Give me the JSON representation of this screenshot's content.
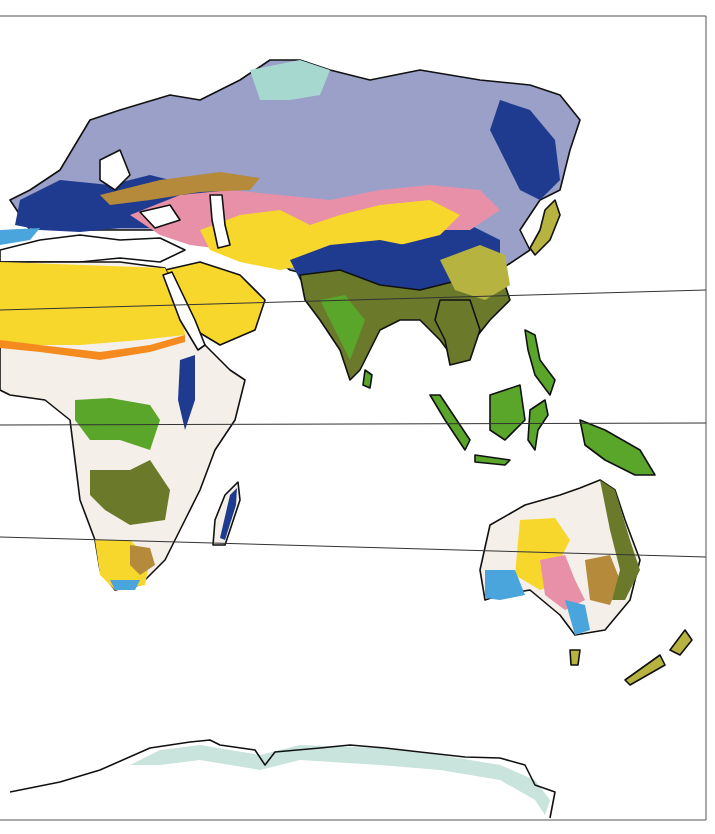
{
  "map": {
    "type": "climate-zones",
    "region": "Eastern Hemisphere",
    "continents": [
      "Europe",
      "Asia",
      "Africa",
      "Australia",
      "Antarctica"
    ],
    "latitude_lines": 3,
    "colors": {
      "ocean": "#ffffff",
      "tundra": "#a7d8cf",
      "subarctic": "#9aa0c8",
      "humid_continental": "#1f3b8f",
      "steppe_brown": "#b58a3a",
      "cool_steppe_pink": "#e790a8",
      "desert_yellow": "#f7d72c",
      "savanna_pale": "#f4efe9",
      "tropical_green": "#5aa62b",
      "monsoon_olive": "#6b7a2a",
      "subtropical_khaki": "#b6b340",
      "mediterranean_blue": "#4aa5dc",
      "sahel_orange": "#f58a1f",
      "ice_fringe": "#c9e4dc",
      "coastline": "#111111"
    }
  }
}
